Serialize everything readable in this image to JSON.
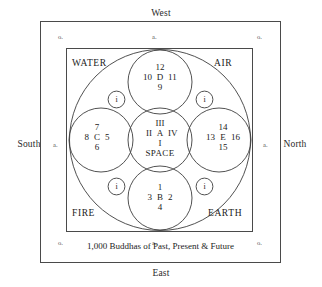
{
  "diagram": {
    "title_caption": "1,000 Buddhas of Past, Present & Future",
    "compass": {
      "top": "West",
      "bottom": "East",
      "left": "South",
      "right": "North"
    },
    "gate_marks": {
      "corner_top_left": "o.",
      "corner_top_right": "o.",
      "corner_bottom_left": "o.",
      "corner_bottom_right": "o.",
      "mid_top": "a.",
      "mid_bottom": "a.",
      "mid_left": "a.",
      "mid_right": "a."
    },
    "elements": {
      "top_left": "WATER",
      "top_right": "AIR",
      "bottom_left": "FIRE",
      "bottom_right": "EARTH"
    },
    "petals": [
      {
        "position": "top",
        "letter": "D",
        "top": "12",
        "left": "10",
        "right": "11",
        "bottom": "9",
        "sub": ""
      },
      {
        "position": "left",
        "letter": "C",
        "top": "7",
        "left": "8",
        "right": "5",
        "bottom": "6",
        "sub": ""
      },
      {
        "position": "center",
        "letter": "A",
        "top": "III",
        "left": "II",
        "right": "IV",
        "bottom": "I",
        "sub": "SPACE"
      },
      {
        "position": "right",
        "letter": "E",
        "top": "14",
        "left": "13",
        "right": "16",
        "bottom": "15",
        "sub": ""
      },
      {
        "position": "bottom",
        "letter": "B",
        "top": "1",
        "left": "3",
        "right": "2",
        "bottom": "4",
        "sub": ""
      }
    ],
    "small_circles": [
      {
        "position": "upper-left",
        "label": "i"
      },
      {
        "position": "upper-right",
        "label": "i"
      },
      {
        "position": "lower-left",
        "label": "i"
      },
      {
        "position": "lower-right",
        "label": "i"
      }
    ]
  }
}
